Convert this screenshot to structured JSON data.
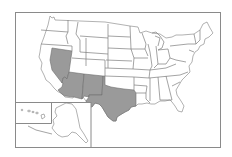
{
  "map": {
    "title": "",
    "subject": "United States map with highlighted states",
    "highlight_color": "#9a9a9a",
    "base_color": "#ffffff",
    "border_color": "#7d7d7d",
    "highlighted_states": [
      "Nevada",
      "Arizona",
      "New Mexico",
      "Texas"
    ],
    "insets": [
      "Alaska",
      "Hawaii"
    ]
  }
}
